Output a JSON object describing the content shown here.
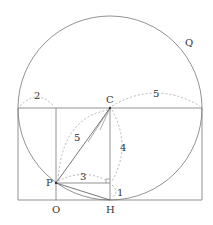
{
  "diagram": {
    "labels": {
      "Q": "Q",
      "C": "C",
      "P": "P",
      "O": "O",
      "H": "H",
      "len_2": "2",
      "len_5_top": "5",
      "len_5_pc": "5",
      "len_4": "4",
      "len_3": "3",
      "len_1": "1"
    },
    "colors": {
      "line": "#777777",
      "dotted": "#999999",
      "text": "#333333"
    }
  }
}
